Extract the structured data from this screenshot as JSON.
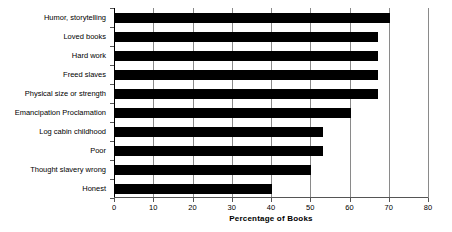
{
  "chart_data": {
    "type": "bar",
    "orientation": "horizontal",
    "title": "",
    "xlabel": "Percentage of Books",
    "ylabel": "",
    "xlim": [
      0,
      80
    ],
    "xticks": [
      0,
      10,
      20,
      30,
      40,
      50,
      60,
      70,
      80
    ],
    "xtick_labels": [
      "0",
      "10",
      "20",
      "30",
      "40",
      "50",
      "60",
      "70",
      "80"
    ],
    "grid": true,
    "grid_axis": "x",
    "legend": false,
    "bar_color": "#000000",
    "background_color": "#ffffff",
    "categories": [
      "Humor, storytelling",
      "Loved books",
      "Hard work",
      "Freed slaves",
      "Physical size or strength",
      "Emancipation Proclamation",
      "Log cabin childhood",
      "Poor",
      "Thought slavery wrong",
      "Honest"
    ],
    "values": [
      70,
      67,
      67,
      67,
      67,
      60,
      53,
      53,
      50,
      40
    ],
    "series": [
      {
        "name": "Percentage of Books",
        "values": [
          70,
          67,
          67,
          67,
          67,
          60,
          53,
          53,
          50,
          40
        ]
      }
    ]
  }
}
